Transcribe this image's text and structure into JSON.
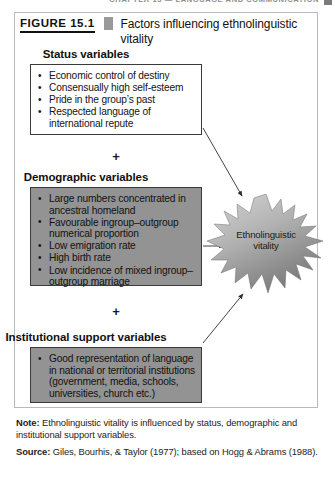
{
  "running_header": {
    "text": "CHAPTER 15 — LANGUAGE AND COMMUNICATION",
    "marker": ""
  },
  "figure": {
    "number_label": "FIGURE 15.1",
    "title": "Factors influencing ethnolinguistic vitality"
  },
  "boxes": [
    {
      "id": "status",
      "heading": "Status variables",
      "bullets": [
        "Economic control of destiny",
        "Consensually high self-esteem",
        "Pride in the group’s past",
        "Respected language of international repute"
      ]
    },
    {
      "id": "demographic",
      "heading": "Demographic variables",
      "bullets": [
        "Large numbers concentrated in ancestral homeland",
        "Favourable ingroup–outgroup numerical proportion",
        "Low emigration rate",
        "High birth rate",
        "Low incidence of mixed ingroup–outgroup marriage"
      ]
    },
    {
      "id": "institutional",
      "heading": "Institutional support variables",
      "bullets": [
        "Good representation of language in national or territorial institutions (government, media, schools, universities, church etc.)"
      ]
    }
  ],
  "connectors": {
    "plus_1": "+",
    "plus_2": "+"
  },
  "outcome": {
    "label": "Ethnolinguistic vitality"
  },
  "footer": {
    "note_label": "Note:",
    "note_text": " Ethnolinguistic vitality is influenced by status, demographic and institutional support variables.",
    "source_label": "Source:",
    "source_text": " Giles, Bourhis, & Taylor (1977); based on Hogg & Abrams (1988)."
  },
  "colors": {
    "box_border": "#3a3a3a",
    "box_shadow": "#c9c9c9",
    "gray_box_fill": "#939393",
    "accent_square": "#9a9a9a",
    "frame_border": "#b9b9b9",
    "starburst_light": "#cfcfcf",
    "starburst_dark": "#7f7f7f"
  }
}
